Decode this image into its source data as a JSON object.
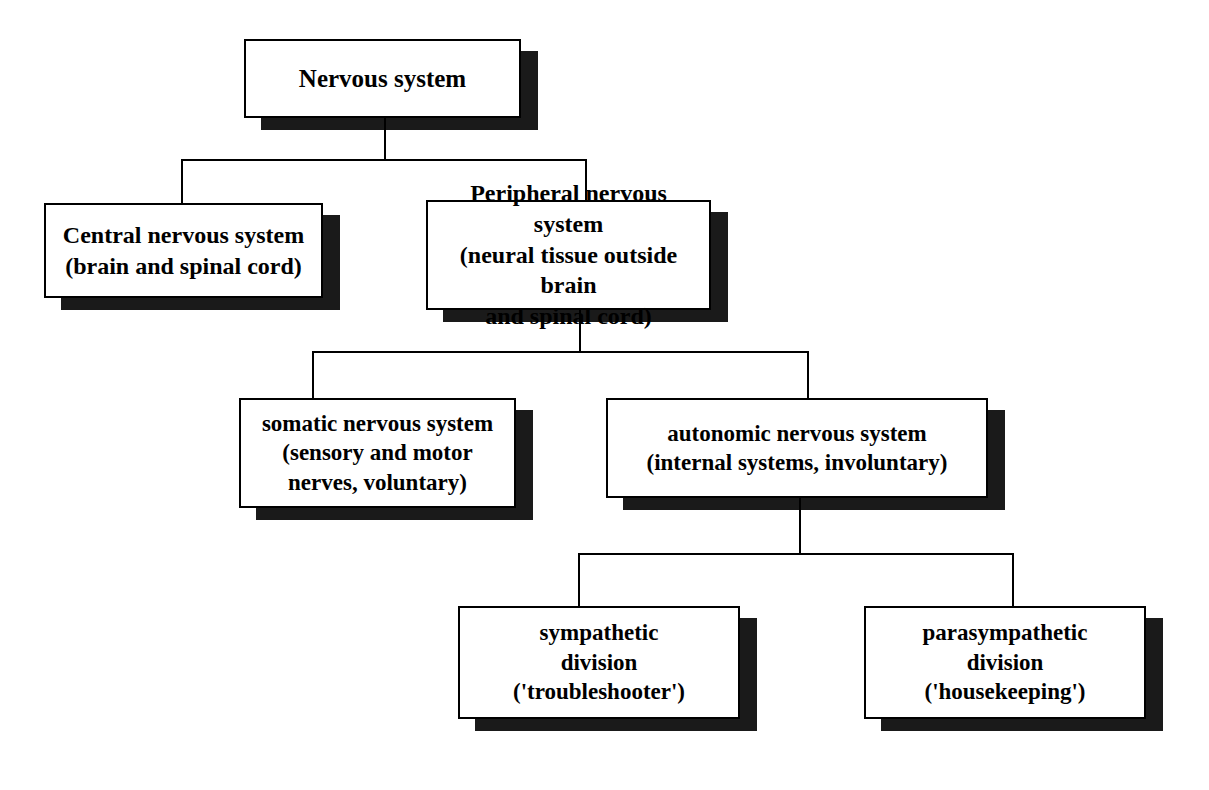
{
  "diagram": {
    "type": "hierarchy-tree",
    "title": "Nervous system",
    "background_color": "#ffffff",
    "box_border_color": "#000000",
    "box_fill_color": "#ffffff",
    "shadow_color": "#1a1a1a",
    "nodes": {
      "root": {
        "label": "Nervous system",
        "level": 0
      },
      "cns": {
        "label": "Central nervous system\n(brain and spinal cord)",
        "level": 1
      },
      "pns": {
        "label": "Peripheral nervous system\n(neural tissue outside brain\nand spinal cord)",
        "level": 1
      },
      "somatic": {
        "label": "somatic nervous system\n(sensory and motor\nnerves, voluntary)",
        "level": 2
      },
      "autonomic": {
        "label": "autonomic nervous system\n(internal systems, involuntary)",
        "level": 2
      },
      "sympathetic": {
        "label": "sympathetic\ndivision\n('troubleshooter')",
        "level": 3
      },
      "parasympathetic": {
        "label": "parasympathetic\ndivision\n('housekeeping')",
        "level": 3
      }
    },
    "edges": [
      {
        "from": "root",
        "to": "cns"
      },
      {
        "from": "root",
        "to": "pns"
      },
      {
        "from": "pns",
        "to": "somatic"
      },
      {
        "from": "pns",
        "to": "autonomic"
      },
      {
        "from": "autonomic",
        "to": "sympathetic"
      },
      {
        "from": "autonomic",
        "to": "parasympathetic"
      }
    ]
  }
}
